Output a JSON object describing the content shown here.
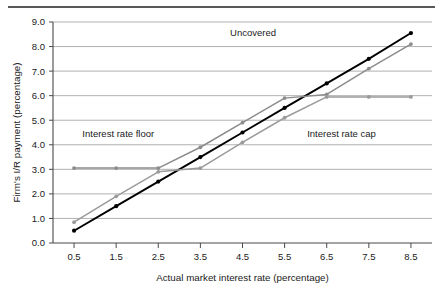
{
  "chart_data": {
    "type": "line",
    "title": "",
    "xlabel": "Actual market interest rate (percentage)",
    "ylabel": "Firm's I/R payment (percentage)",
    "x": [
      0.5,
      1.5,
      2.5,
      3.5,
      4.5,
      5.5,
      6.5,
      7.5,
      8.5
    ],
    "xtick_labels": [
      "0.5",
      "1.5",
      "2.5",
      "3.5",
      "4.5",
      "5.5",
      "6.5",
      "7.5",
      "8.5"
    ],
    "ytick_labels": [
      "0.0",
      "1.0",
      "2.0",
      "3.0",
      "4.0",
      "5.0",
      "6.0",
      "7.0",
      "8.0",
      "9.0"
    ],
    "xlim": [
      0.0,
      9.0
    ],
    "ylim": [
      0.0,
      9.0
    ],
    "grid": "horizontal",
    "legend": "none",
    "series": [
      {
        "name": "Uncovered",
        "color": "#000000",
        "values": [
          0.5,
          1.5,
          2.5,
          3.5,
          4.5,
          5.5,
          6.5,
          7.5,
          8.55
        ]
      },
      {
        "name": "Interest rate floor",
        "color": "#8c8c8c",
        "values": [
          3.05,
          3.05,
          3.05,
          3.9,
          4.9,
          5.9,
          6.05,
          7.1,
          8.1
        ]
      },
      {
        "name": "Interest rate cap",
        "color": "#9a9a9a",
        "values": [
          0.85,
          1.9,
          2.9,
          3.05,
          4.1,
          5.1,
          5.95,
          5.95,
          5.95
        ]
      }
    ],
    "annotations": [
      {
        "text": "Uncovered",
        "x": 4.75,
        "y": 8.45
      },
      {
        "text": "Interest rate floor",
        "x": 1.55,
        "y": 4.3
      },
      {
        "text": "Interest rate cap",
        "x": 6.85,
        "y": 4.3
      }
    ]
  }
}
